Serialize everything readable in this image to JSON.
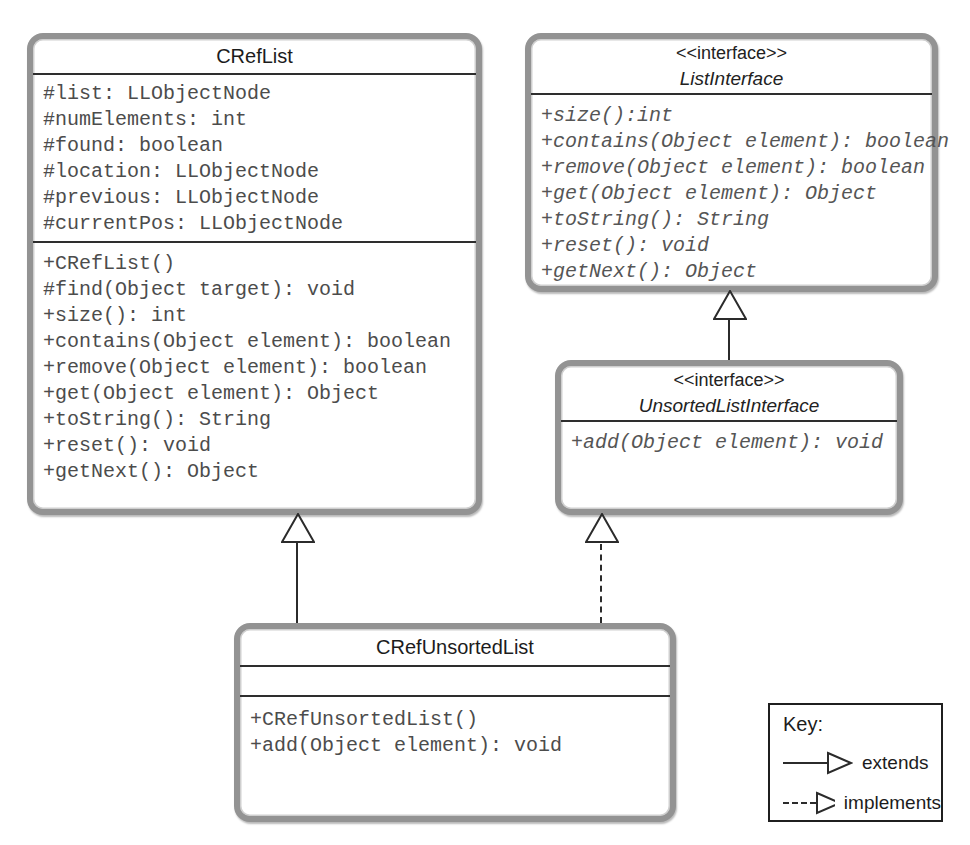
{
  "diagram": {
    "classes": [
      {
        "name": "CRefList",
        "attributes": [
          "#list: LLObjectNode",
          "#numElements: int",
          "#found: boolean",
          "#location: LLObjectNode",
          "#previous: LLObjectNode",
          "#currentPos: LLObjectNode"
        ],
        "methods": [
          "+CRefList()",
          "#find(Object target): void",
          "+size(): int",
          "+contains(Object element): boolean",
          "+remove(Object element): boolean",
          "+get(Object element): Object",
          "+toString(): String",
          "+reset(): void",
          "+getNext(): Object"
        ]
      },
      {
        "stereotype": "<<interface>>",
        "name": "ListInterface",
        "methods": [
          "+size():int",
          "+contains(Object element): boolean",
          "+remove(Object element): boolean",
          "+get(Object element): Object",
          "+toString(): String",
          "+reset(): void",
          "+getNext(): Object"
        ]
      },
      {
        "stereotype": "<<interface>>",
        "name": "UnsortedListInterface",
        "methods": [
          "+add(Object element): void"
        ]
      },
      {
        "name": "CRefUnsortedList",
        "attributes": [],
        "methods": [
          "+CRefUnsortedList()",
          "+add(Object element): void"
        ]
      }
    ],
    "relationships": [
      {
        "from": "CRefUnsortedList",
        "to": "CRefList",
        "type": "extends"
      },
      {
        "from": "CRefUnsortedList",
        "to": "UnsortedListInterface",
        "type": "implements"
      },
      {
        "from": "UnsortedListInterface",
        "to": "ListInterface",
        "type": "extends"
      }
    ],
    "key": {
      "title": "Key:",
      "entries": [
        {
          "label": "extends",
          "line": "solid"
        },
        {
          "label": "implements",
          "line": "dashed"
        }
      ]
    },
    "colors": {
      "box_border": "#939393",
      "line": "#2b2b2b",
      "member_text": "#4c4c4c",
      "title_text": "#1c1c1c"
    }
  }
}
